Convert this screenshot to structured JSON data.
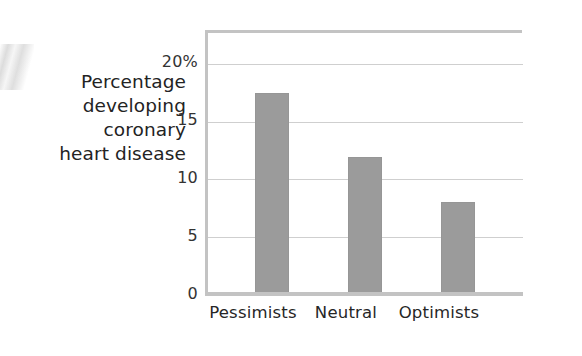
{
  "chart_data": {
    "type": "bar",
    "title": "",
    "subtitle": "",
    "xlabel": "",
    "ylabel": "Percentage developing coronary heart disease",
    "ylabel_lines": [
      "Percentage",
      "developing",
      "coronary",
      "heart disease"
    ],
    "categories": [
      "Pessimists",
      "Neutral",
      "Optimists"
    ],
    "values": [
      17.3,
      11.8,
      7.9
    ],
    "ylim": [
      0,
      22.5
    ],
    "yticks": [
      0,
      5,
      10,
      15,
      20
    ],
    "ytick_labels": [
      "0",
      "5",
      "10",
      "15",
      "20%"
    ],
    "grid": true,
    "grid_axis": "y",
    "legend": false,
    "legend_position": "none",
    "bar_color": "#9b9b9b",
    "gridline_color": "#cfcfcf",
    "axis_color": "#c3c3c3",
    "text_color": "#262626",
    "units": "percent"
  },
  "axis": {
    "y_title_line_1": "Percentage",
    "y_title_line_2": "developing",
    "y_title_line_3": "coronary",
    "y_title_line_4": "heart disease",
    "tick_20": "20%",
    "tick_15": "15",
    "tick_10": "10",
    "tick_5": "5",
    "tick_0": "0"
  },
  "categories": {
    "c0": "Pessimists",
    "c1": "Neutral",
    "c2": "Optimists"
  }
}
